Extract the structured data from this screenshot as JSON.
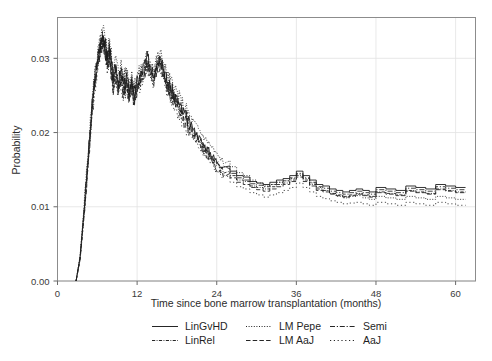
{
  "chart_data": {
    "type": "line",
    "title": "",
    "xlabel": "Time since bone marrow transplantation (months)",
    "ylabel": "Probability",
    "xlim": [
      0,
      63
    ],
    "ylim": [
      0,
      0.0355
    ],
    "xticks": [
      0,
      12,
      24,
      36,
      48,
      60
    ],
    "xticklabels": [
      "0",
      "12",
      "24",
      "36",
      "48",
      "60"
    ],
    "yticks": [
      0.0,
      0.01,
      0.02,
      0.03
    ],
    "yticklabels": [
      "0.00",
      "0.01",
      "0.02",
      "0.03"
    ],
    "grid": true,
    "grid_color": "#e2e2e2",
    "frame_color": "#8c8c8c",
    "legend_position": "below",
    "legend_columns": 3,
    "legend_rows": 2,
    "series": [
      {
        "name": "LinGvHD",
        "dash": "solid",
        "color": "#111111",
        "x": [
          2.8,
          3.4,
          4.0,
          4.6,
          5.2,
          5.6,
          6.0,
          6.3,
          6.6,
          6.9,
          7.2,
          7.5,
          7.8,
          8.1,
          8.4,
          8.8,
          9.2,
          9.6,
          10.0,
          10.4,
          10.8,
          11.2,
          11.6,
          12.0,
          12.5,
          13.0,
          13.5,
          14.0,
          14.5,
          15.0,
          15.5,
          16.0,
          16.5,
          17.0,
          17.5,
          18.0,
          18.6,
          19.2,
          19.8,
          20.4,
          21.0,
          21.6,
          22.2,
          22.8,
          23.4,
          24.0,
          25.0,
          26.0,
          27.0,
          28.0,
          29.0,
          30.0,
          31.0,
          32.0,
          33.0,
          34.0,
          35.0,
          36.0,
          37.0,
          38.0,
          39.0,
          40.0,
          41.0,
          42.0,
          43.0,
          44.0,
          45.0,
          46.0,
          47.0,
          48.0,
          49.5,
          51.0,
          52.5,
          54.0,
          55.5,
          57.0,
          58.5,
          60.0,
          61.5
        ],
        "y": [
          0.0,
          0.0032,
          0.0095,
          0.0165,
          0.0235,
          0.0272,
          0.0296,
          0.031,
          0.0325,
          0.0333,
          0.0318,
          0.0302,
          0.0314,
          0.0296,
          0.0272,
          0.029,
          0.0268,
          0.0282,
          0.0262,
          0.0276,
          0.0258,
          0.027,
          0.0252,
          0.0268,
          0.0276,
          0.0288,
          0.03,
          0.0292,
          0.028,
          0.0296,
          0.0302,
          0.0286,
          0.027,
          0.0262,
          0.0252,
          0.0244,
          0.0232,
          0.0224,
          0.0214,
          0.0206,
          0.0198,
          0.019,
          0.0182,
          0.0176,
          0.0168,
          0.0162,
          0.0155,
          0.0148,
          0.0142,
          0.014,
          0.0134,
          0.0132,
          0.013,
          0.0133,
          0.0136,
          0.0138,
          0.0142,
          0.0148,
          0.0142,
          0.0136,
          0.013,
          0.0128,
          0.0124,
          0.0122,
          0.012,
          0.0122,
          0.0124,
          0.0122,
          0.012,
          0.0126,
          0.0124,
          0.0122,
          0.0128,
          0.0126,
          0.0124,
          0.013,
          0.0128,
          0.0126,
          0.0126
        ]
      },
      {
        "name": "LinRel",
        "dash": "dashdot-fine",
        "color": "#1a1a1a",
        "x": [
          2.8,
          3.4,
          4.0,
          4.6,
          5.2,
          5.6,
          6.0,
          6.3,
          6.6,
          6.9,
          7.2,
          7.5,
          7.8,
          8.1,
          8.4,
          8.8,
          9.2,
          9.6,
          10.0,
          10.4,
          10.8,
          11.2,
          11.6,
          12.0,
          12.5,
          13.0,
          13.5,
          14.0,
          14.5,
          15.0,
          15.5,
          16.0,
          16.5,
          17.0,
          17.5,
          18.0,
          18.6,
          19.2,
          19.8,
          20.4,
          21.0,
          21.6,
          22.2,
          22.8,
          23.4,
          24.0,
          25.0,
          26.0,
          27.0,
          28.0,
          29.0,
          30.0,
          31.0,
          32.0,
          33.0,
          34.0,
          35.0,
          36.0,
          37.0,
          38.0,
          39.0,
          40.0,
          41.0,
          42.0,
          43.0,
          44.0,
          45.0,
          46.0,
          47.0,
          48.0,
          49.5,
          51.0,
          52.5,
          54.0,
          55.5,
          57.0,
          58.5,
          60.0,
          61.5
        ],
        "y": [
          0.0,
          0.003,
          0.009,
          0.016,
          0.0228,
          0.0266,
          0.0292,
          0.0306,
          0.0318,
          0.0327,
          0.031,
          0.0294,
          0.0306,
          0.0288,
          0.0264,
          0.0282,
          0.026,
          0.0274,
          0.0254,
          0.0268,
          0.025,
          0.0262,
          0.0244,
          0.026,
          0.027,
          0.0282,
          0.0294,
          0.0286,
          0.0274,
          0.029,
          0.0296,
          0.028,
          0.0264,
          0.0256,
          0.0246,
          0.0238,
          0.0226,
          0.0218,
          0.0208,
          0.02,
          0.0192,
          0.0184,
          0.0176,
          0.017,
          0.0162,
          0.0156,
          0.0148,
          0.0142,
          0.0136,
          0.0134,
          0.0128,
          0.0126,
          0.0124,
          0.0127,
          0.013,
          0.0132,
          0.0136,
          0.0142,
          0.0136,
          0.013,
          0.0124,
          0.0122,
          0.0118,
          0.0116,
          0.0114,
          0.0116,
          0.0118,
          0.0116,
          0.0114,
          0.012,
          0.0118,
          0.0116,
          0.0122,
          0.012,
          0.0118,
          0.0124,
          0.0122,
          0.012,
          0.012
        ]
      },
      {
        "name": "LM Pepe",
        "dash": "dotted",
        "color": "#222222",
        "x": [
          2.8,
          3.4,
          4.0,
          4.6,
          5.2,
          5.6,
          6.0,
          6.3,
          6.6,
          6.9,
          7.2,
          7.5,
          7.8,
          8.1,
          8.4,
          8.8,
          9.2,
          9.6,
          10.0,
          10.4,
          10.8,
          11.2,
          11.6,
          12.0,
          12.5,
          13.0,
          13.5,
          14.0,
          14.5,
          15.0,
          15.5,
          16.0,
          16.5,
          17.0,
          17.5,
          18.0,
          18.6,
          19.2,
          19.8,
          20.4,
          21.0,
          21.6,
          22.2,
          22.8,
          23.4,
          24.0,
          25.0,
          26.0,
          27.0,
          28.0,
          29.0,
          30.0,
          31.0,
          32.0,
          33.0,
          34.0,
          35.0,
          36.0,
          37.0,
          38.0,
          39.0,
          40.0,
          41.0,
          42.0,
          43.0,
          44.0,
          45.0,
          46.0,
          47.0,
          48.0,
          49.5,
          51.0,
          52.5,
          54.0,
          55.5,
          57.0,
          58.5,
          60.0,
          61.5
        ],
        "y": [
          0.0,
          0.0034,
          0.01,
          0.0172,
          0.0242,
          0.028,
          0.0304,
          0.0318,
          0.033,
          0.0338,
          0.0326,
          0.0312,
          0.0322,
          0.0306,
          0.0284,
          0.03,
          0.028,
          0.0292,
          0.0274,
          0.0286,
          0.027,
          0.028,
          0.0264,
          0.0276,
          0.0284,
          0.0294,
          0.0304,
          0.0298,
          0.0288,
          0.03,
          0.0306,
          0.0292,
          0.0278,
          0.027,
          0.0262,
          0.0254,
          0.0242,
          0.0234,
          0.0224,
          0.0216,
          0.0208,
          0.02,
          0.0192,
          0.0186,
          0.0178,
          0.017,
          0.0162,
          0.0154,
          0.0146,
          0.0142,
          0.0136,
          0.0132,
          0.0128,
          0.013,
          0.0133,
          0.0135,
          0.0138,
          0.0144,
          0.0138,
          0.0132,
          0.0126,
          0.0122,
          0.0118,
          0.0114,
          0.0112,
          0.0114,
          0.0115,
          0.0112,
          0.011,
          0.0114,
          0.0112,
          0.011,
          0.0114,
          0.0112,
          0.011,
          0.0114,
          0.0112,
          0.011,
          0.011
        ]
      },
      {
        "name": "LM AaJ",
        "dash": "dashed",
        "color": "#1a1a1a",
        "x": [
          2.8,
          3.4,
          4.0,
          4.6,
          5.2,
          5.6,
          6.0,
          6.3,
          6.6,
          6.9,
          7.2,
          7.5,
          7.8,
          8.1,
          8.4,
          8.8,
          9.2,
          9.6,
          10.0,
          10.4,
          10.8,
          11.2,
          11.6,
          12.0,
          12.5,
          13.0,
          13.5,
          14.0,
          14.5,
          15.0,
          15.5,
          16.0,
          16.5,
          17.0,
          17.5,
          18.0,
          18.6,
          19.2,
          19.8,
          20.4,
          21.0,
          21.6,
          22.2,
          22.8,
          23.4,
          24.0,
          25.0,
          26.0,
          27.0,
          28.0,
          29.0,
          30.0,
          31.0,
          32.0,
          33.0,
          34.0,
          35.0,
          36.0,
          37.0,
          38.0,
          39.0,
          40.0,
          41.0,
          42.0,
          43.0,
          44.0,
          45.0,
          46.0,
          47.0,
          48.0,
          49.5,
          51.0,
          52.5,
          54.0,
          55.5,
          57.0,
          58.5,
          60.0,
          61.5
        ],
        "y": [
          0.0,
          0.0029,
          0.0088,
          0.0156,
          0.0224,
          0.0262,
          0.0288,
          0.0302,
          0.0314,
          0.0322,
          0.0306,
          0.029,
          0.03,
          0.0282,
          0.026,
          0.0276,
          0.0256,
          0.0268,
          0.025,
          0.0262,
          0.0246,
          0.0258,
          0.024,
          0.0256,
          0.0266,
          0.0278,
          0.029,
          0.0282,
          0.027,
          0.0286,
          0.0292,
          0.0276,
          0.0262,
          0.0252,
          0.0242,
          0.0234,
          0.0222,
          0.0214,
          0.0205,
          0.0197,
          0.0189,
          0.0181,
          0.0173,
          0.0167,
          0.0159,
          0.0152,
          0.0145,
          0.0139,
          0.0133,
          0.013,
          0.0126,
          0.0123,
          0.0121,
          0.0124,
          0.0127,
          0.013,
          0.0134,
          0.014,
          0.0134,
          0.0128,
          0.0122,
          0.012,
          0.0117,
          0.0115,
          0.0113,
          0.0115,
          0.0117,
          0.0115,
          0.0113,
          0.0119,
          0.0117,
          0.0115,
          0.0121,
          0.0119,
          0.0117,
          0.0123,
          0.0121,
          0.0119,
          0.0119
        ]
      },
      {
        "name": "Semi",
        "dash": "dashdot",
        "color": "#1f1f1f",
        "x": [
          2.8,
          3.4,
          4.0,
          4.6,
          5.2,
          5.6,
          6.0,
          6.3,
          6.6,
          6.9,
          7.2,
          7.5,
          7.8,
          8.1,
          8.4,
          8.8,
          9.2,
          9.6,
          10.0,
          10.4,
          10.8,
          11.2,
          11.6,
          12.0,
          12.5,
          13.0,
          13.5,
          14.0,
          14.5,
          15.0,
          15.5,
          16.0,
          16.5,
          17.0,
          17.5,
          18.0,
          18.6,
          19.2,
          19.8,
          20.4,
          21.0,
          21.6,
          22.2,
          22.8,
          23.4,
          24.0,
          25.0,
          26.0,
          27.0,
          28.0,
          29.0,
          30.0,
          31.0,
          32.0,
          33.0,
          34.0,
          35.0,
          36.0,
          37.0,
          38.0,
          39.0,
          40.0,
          41.0,
          42.0,
          43.0,
          44.0,
          45.0,
          46.0,
          47.0,
          48.0,
          49.5,
          51.0,
          52.5,
          54.0,
          55.5,
          57.0,
          58.5,
          60.0,
          61.5
        ],
        "y": [
          0.0,
          0.0031,
          0.0093,
          0.0163,
          0.0232,
          0.027,
          0.0294,
          0.0308,
          0.0321,
          0.033,
          0.0314,
          0.0298,
          0.031,
          0.0292,
          0.0268,
          0.0286,
          0.0264,
          0.0278,
          0.0258,
          0.0272,
          0.0254,
          0.0266,
          0.0248,
          0.0264,
          0.0272,
          0.0285,
          0.0297,
          0.0289,
          0.0277,
          0.0293,
          0.0299,
          0.0283,
          0.0267,
          0.0259,
          0.0249,
          0.0241,
          0.0229,
          0.0221,
          0.0211,
          0.0203,
          0.0195,
          0.0187,
          0.0179,
          0.0173,
          0.0165,
          0.0159,
          0.0151,
          0.0145,
          0.0139,
          0.0136,
          0.0131,
          0.0129,
          0.0127,
          0.013,
          0.0133,
          0.0135,
          0.0139,
          0.0145,
          0.0139,
          0.0133,
          0.0127,
          0.0125,
          0.0121,
          0.0119,
          0.0117,
          0.0119,
          0.0121,
          0.0119,
          0.0117,
          0.0123,
          0.0121,
          0.0119,
          0.0125,
          0.0123,
          0.0121,
          0.0127,
          0.0125,
          0.0123,
          0.0123
        ]
      },
      {
        "name": "AaJ",
        "dash": "dotted-wide",
        "color": "#2a2a2a",
        "x": [
          2.8,
          3.4,
          4.0,
          4.6,
          5.2,
          5.6,
          6.0,
          6.3,
          6.6,
          6.9,
          7.2,
          7.5,
          7.8,
          8.1,
          8.4,
          8.8,
          9.2,
          9.6,
          10.0,
          10.4,
          10.8,
          11.2,
          11.6,
          12.0,
          12.5,
          13.0,
          13.5,
          14.0,
          14.5,
          15.0,
          15.5,
          16.0,
          16.5,
          17.0,
          17.5,
          18.0,
          18.6,
          19.2,
          19.8,
          20.4,
          21.0,
          21.6,
          22.2,
          22.8,
          23.4,
          24.0,
          25.0,
          26.0,
          27.0,
          28.0,
          29.0,
          30.0,
          31.0,
          32.0,
          33.0,
          34.0,
          35.0,
          36.0,
          37.0,
          38.0,
          39.0,
          40.0,
          41.0,
          42.0,
          43.0,
          44.0,
          45.0,
          46.0,
          47.0,
          48.0,
          49.5,
          51.0,
          52.5,
          54.0,
          55.5,
          57.0,
          58.5,
          60.0,
          61.5
        ],
        "y": [
          0.0,
          0.0028,
          0.0086,
          0.0153,
          0.022,
          0.0258,
          0.0284,
          0.0299,
          0.0311,
          0.0319,
          0.0302,
          0.0286,
          0.0296,
          0.0278,
          0.0256,
          0.0272,
          0.0252,
          0.0264,
          0.0246,
          0.0258,
          0.0242,
          0.0254,
          0.0237,
          0.0252,
          0.0262,
          0.0274,
          0.0286,
          0.0278,
          0.0266,
          0.0282,
          0.0288,
          0.0272,
          0.0258,
          0.0248,
          0.0238,
          0.023,
          0.0218,
          0.021,
          0.0201,
          0.0193,
          0.0185,
          0.0177,
          0.0169,
          0.0163,
          0.0155,
          0.0148,
          0.014,
          0.0133,
          0.0127,
          0.0124,
          0.0119,
          0.0116,
          0.0113,
          0.0116,
          0.0119,
          0.0122,
          0.0126,
          0.0132,
          0.0126,
          0.012,
          0.0114,
          0.0111,
          0.0108,
          0.0106,
          0.0104,
          0.0105,
          0.0106,
          0.0104,
          0.0102,
          0.0106,
          0.0104,
          0.0102,
          0.0106,
          0.0104,
          0.0102,
          0.0106,
          0.0104,
          0.0102,
          0.0102
        ]
      }
    ]
  },
  "legend": {
    "entries": [
      {
        "label": "LinGvHD",
        "dash": "solid"
      },
      {
        "label": "LM Pepe",
        "dash": "dotted"
      },
      {
        "label": "Semi",
        "dash": "dashdot"
      },
      {
        "label": "LinRel",
        "dash": "dashdot-fine"
      },
      {
        "label": "LM AaJ",
        "dash": "dashed"
      },
      {
        "label": "AaJ",
        "dash": "dotted-wide"
      }
    ]
  }
}
